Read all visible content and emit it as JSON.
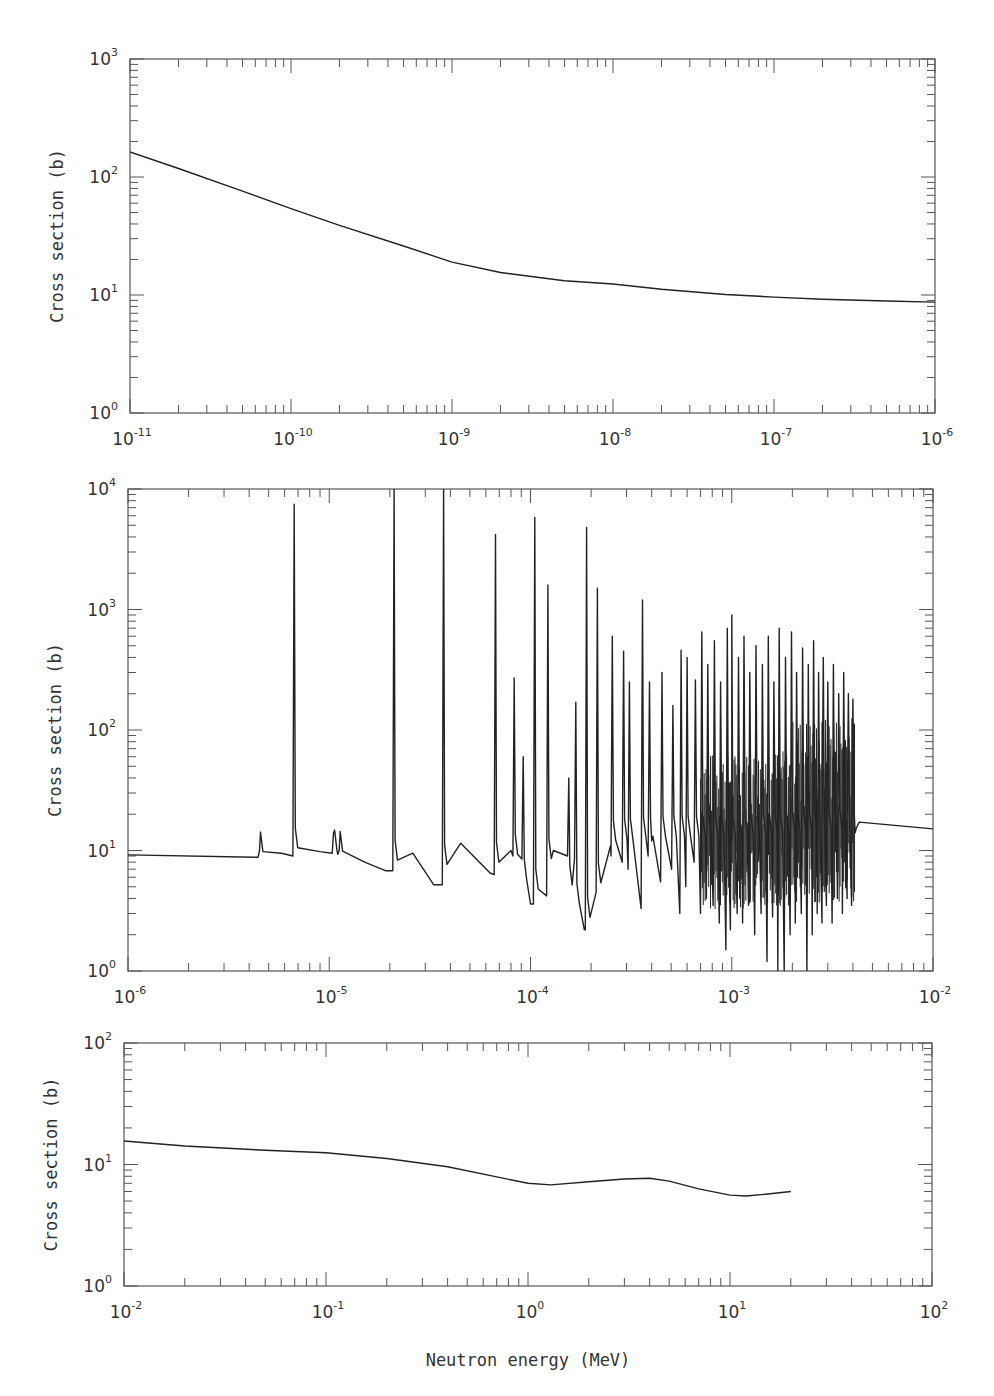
{
  "chart_data": [
    {
      "type": "line",
      "panel": "top",
      "title": "",
      "xlabel": "",
      "ylabel": "Cross section (b)",
      "xscale": "log",
      "yscale": "log",
      "xlim": [
        1e-11,
        1e-06
      ],
      "ylim": [
        1,
        1000
      ],
      "x_tick_labels": [
        "10^-11",
        "10^-10",
        "10^-9",
        "10^-8",
        "10^-7",
        "10^-6"
      ],
      "y_tick_labels": [
        "10^0",
        "10^1",
        "10^2",
        "10^3"
      ],
      "grid": false,
      "legend": null,
      "series": [
        {
          "name": "cross-section",
          "x": [
            1e-11,
            2e-11,
            5e-11,
            1e-10,
            2e-10,
            5e-10,
            1e-09,
            2e-09,
            5e-09,
            1e-08,
            2e-08,
            5e-08,
            1e-07,
            2e-07,
            5e-07,
            1e-06
          ],
          "y": [
            163,
            118,
            76,
            54,
            39,
            26,
            19,
            15.5,
            13.2,
            12.4,
            11.2,
            10.1,
            9.6,
            9.2,
            8.9,
            8.7
          ]
        }
      ]
    },
    {
      "type": "line",
      "panel": "middle",
      "title": "",
      "xlabel": "",
      "ylabel": "Cross section (b)",
      "xscale": "log",
      "yscale": "log",
      "xlim": [
        1e-06,
        0.01
      ],
      "ylim": [
        1,
        10000
      ],
      "x_tick_labels": [
        "10^-6",
        "10^-5",
        "10^-4",
        "10^-3",
        "10^-2"
      ],
      "y_tick_labels": [
        "10^0",
        "10^1",
        "10^2",
        "10^3",
        "10^4"
      ],
      "grid": false,
      "legend": null,
      "baseline": [
        {
          "x": 1e-06,
          "y": 9.2
        },
        {
          "x": 4.3e-06,
          "y": 8.8
        },
        {
          "x": 5.8e-06,
          "y": 9.5
        },
        {
          "x": 9e-06,
          "y": 9.8
        },
        {
          "x": 1.5e-05,
          "y": 8.0
        },
        {
          "x": 1.9e-05,
          "y": 6.8
        },
        {
          "x": 2.6e-05,
          "y": 9.5
        },
        {
          "x": 3.3e-05,
          "y": 5.2
        },
        {
          "x": 4.5e-05,
          "y": 11.5
        },
        {
          "x": 6.3e-05,
          "y": 6.5
        },
        {
          "x": 8e-05,
          "y": 10
        },
        {
          "x": 0.0001,
          "y": 3.6
        },
        {
          "x": 0.00013,
          "y": 10
        },
        {
          "x": 0.000185,
          "y": 2.2
        },
        {
          "x": 0.00025,
          "y": 11
        },
        {
          "x": 0.0004,
          "y": 12
        },
        {
          "x": 0.001,
          "y": 12
        },
        {
          "x": 0.0041,
          "y": 14
        },
        {
          "x": 0.0043,
          "y": 17.2
        },
        {
          "x": 0.01,
          "y": 15.1
        }
      ],
      "resonances": [
        {
          "x": 4.5e-06,
          "peak": 10,
          "dip": 8.8
        },
        {
          "x": 6.7e-06,
          "peak": 7500,
          "dip": 9
        },
        {
          "x": 1.05e-05,
          "peak": 14,
          "dip": 9.5
        },
        {
          "x": 1.12e-05,
          "peak": 10,
          "dip": 9.3
        },
        {
          "x": 2.1e-05,
          "peak": 10000,
          "dip": 6.8
        },
        {
          "x": 3.7e-05,
          "peak": 10000,
          "dip": 5.2
        },
        {
          "x": 6.7e-05,
          "peak": 4200,
          "dip": 6.3
        },
        {
          "x": 8.3e-05,
          "peak": 270,
          "dip": 9
        },
        {
          "x": 9.2e-05,
          "peak": 60,
          "dip": 8.5
        },
        {
          "x": 0.000105,
          "peak": 5800,
          "dip": 3.6
        },
        {
          "x": 0.000122,
          "peak": 1600,
          "dip": 4.2
        },
        {
          "x": 0.000155,
          "peak": 40,
          "dip": 9
        },
        {
          "x": 0.000168,
          "peak": 170,
          "dip": 8.5
        },
        {
          "x": 0.00019,
          "peak": 4800,
          "dip": 2.2
        },
        {
          "x": 0.000215,
          "peak": 1500,
          "dip": 4.5
        },
        {
          "x": 0.000255,
          "peak": 600,
          "dip": 9
        },
        {
          "x": 0.00029,
          "peak": 450,
          "dip": 8
        },
        {
          "x": 0.00031,
          "peak": 250,
          "dip": 7
        },
        {
          "x": 0.00036,
          "peak": 1200,
          "dip": 3.3
        },
        {
          "x": 0.00039,
          "peak": 250,
          "dip": 9
        },
        {
          "x": 0.00045,
          "peak": 300,
          "dip": 5.5
        },
        {
          "x": 0.00051,
          "peak": 160,
          "dip": 7
        },
        {
          "x": 0.00056,
          "peak": 460,
          "dip": 3
        },
        {
          "x": 0.0006,
          "peak": 400,
          "dip": 5
        },
        {
          "x": 0.00066,
          "peak": 260,
          "dip": 8
        },
        {
          "x": 0.00071,
          "peak": 650,
          "dip": 3
        },
        {
          "x": 0.00076,
          "peak": 350,
          "dip": 4
        },
        {
          "x": 0.00082,
          "peak": 550,
          "dip": 3.5
        },
        {
          "x": 0.00088,
          "peak": 250,
          "dip": 2.5
        },
        {
          "x": 0.00095,
          "peak": 700,
          "dip": 1.5
        },
        {
          "x": 0.001,
          "peak": 900,
          "dip": 2.2
        },
        {
          "x": 0.00108,
          "peak": 400,
          "dip": 3
        },
        {
          "x": 0.00115,
          "peak": 600,
          "dip": 2.5
        },
        {
          "x": 0.00123,
          "peak": 300,
          "dip": 3.5
        },
        {
          "x": 0.00132,
          "peak": 500,
          "dip": 2
        },
        {
          "x": 0.00142,
          "peak": 350,
          "dip": 3
        },
        {
          "x": 0.00152,
          "peak": 600,
          "dip": 1.2
        },
        {
          "x": 0.00162,
          "peak": 250,
          "dip": 2.8
        },
        {
          "x": 0.00172,
          "peak": 700,
          "dip": 1
        },
        {
          "x": 0.00185,
          "peak": 400,
          "dip": 1
        },
        {
          "x": 0.00198,
          "peak": 650,
          "dip": 2
        },
        {
          "x": 0.0021,
          "peak": 300,
          "dip": 2.5
        },
        {
          "x": 0.00225,
          "peak": 480,
          "dip": 3
        },
        {
          "x": 0.0024,
          "peak": 350,
          "dip": 1
        },
        {
          "x": 0.00255,
          "peak": 550,
          "dip": 2
        },
        {
          "x": 0.0027,
          "peak": 300,
          "dip": 3
        },
        {
          "x": 0.00285,
          "peak": 400,
          "dip": 2.5
        },
        {
          "x": 0.003,
          "peak": 250,
          "dip": 3.5
        },
        {
          "x": 0.0032,
          "peak": 350,
          "dip": 2.5
        },
        {
          "x": 0.0034,
          "peak": 200,
          "dip": 4
        },
        {
          "x": 0.0036,
          "peak": 300,
          "dip": 3
        },
        {
          "x": 0.0038,
          "peak": 200,
          "dip": 4
        },
        {
          "x": 0.004,
          "peak": 180,
          "dip": 3.5
        }
      ]
    },
    {
      "type": "line",
      "panel": "bottom",
      "title": "",
      "xlabel": "Neutron energy (MeV)",
      "ylabel": "Cross section (b)",
      "xscale": "log",
      "yscale": "log",
      "xlim": [
        0.01,
        100
      ],
      "ylim": [
        1,
        100
      ],
      "x_tick_labels": [
        "10^-2",
        "10^-1",
        "10^0",
        "10^1",
        "10^2"
      ],
      "y_tick_labels": [
        "10^0",
        "10^1",
        "10^2"
      ],
      "grid": false,
      "legend": null,
      "series": [
        {
          "name": "cross-section",
          "x": [
            0.01,
            0.02,
            0.05,
            0.1,
            0.2,
            0.4,
            0.7,
            1.0,
            1.3,
            2.0,
            3.0,
            4.0,
            5.0,
            7.0,
            10,
            12,
            15,
            20
          ],
          "y": [
            15.6,
            14.2,
            13.1,
            12.5,
            11.2,
            9.6,
            7.9,
            7.0,
            6.8,
            7.2,
            7.6,
            7.7,
            7.3,
            6.3,
            5.6,
            5.5,
            5.7,
            6.0
          ]
        }
      ]
    }
  ],
  "panels": {
    "top": {
      "ylabel": "Cross section (b)",
      "xticks": [
        {
          "base": "10",
          "exp": "-11"
        },
        {
          "base": "10",
          "exp": "-10"
        },
        {
          "base": "10",
          "exp": "-9"
        },
        {
          "base": "10",
          "exp": "-8"
        },
        {
          "base": "10",
          "exp": "-7"
        },
        {
          "base": "10",
          "exp": "-6"
        }
      ],
      "yticks": [
        {
          "base": "10",
          "exp": "0"
        },
        {
          "base": "10",
          "exp": "1"
        },
        {
          "base": "10",
          "exp": "2"
        },
        {
          "base": "10",
          "exp": "3"
        }
      ]
    },
    "middle": {
      "ylabel": "Cross section (b)",
      "xticks": [
        {
          "base": "10",
          "exp": "-6"
        },
        {
          "base": "10",
          "exp": "-5"
        },
        {
          "base": "10",
          "exp": "-4"
        },
        {
          "base": "10",
          "exp": "-3"
        },
        {
          "base": "10",
          "exp": "-2"
        }
      ],
      "yticks": [
        {
          "base": "10",
          "exp": "0"
        },
        {
          "base": "10",
          "exp": "1"
        },
        {
          "base": "10",
          "exp": "2"
        },
        {
          "base": "10",
          "exp": "3"
        },
        {
          "base": "10",
          "exp": "4"
        }
      ]
    },
    "bottom": {
      "ylabel": "Cross section (b)",
      "xlabel": "Neutron energy (MeV)",
      "xticks": [
        {
          "base": "10",
          "exp": "-2"
        },
        {
          "base": "10",
          "exp": "-1"
        },
        {
          "base": "10",
          "exp": "0"
        },
        {
          "base": "10",
          "exp": "1"
        },
        {
          "base": "10",
          "exp": "2"
        }
      ],
      "yticks": [
        {
          "base": "10",
          "exp": "0"
        },
        {
          "base": "10",
          "exp": "1"
        },
        {
          "base": "10",
          "exp": "2"
        }
      ]
    }
  },
  "colors": {
    "line": "#222222",
    "axis": "#555555",
    "text": "#333333",
    "background": "#ffffff"
  }
}
